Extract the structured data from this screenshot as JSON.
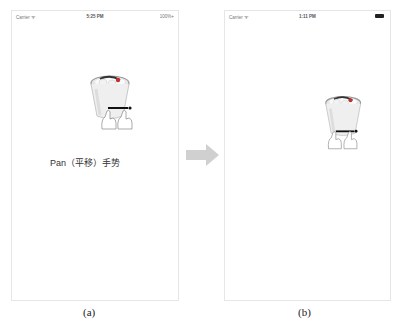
{
  "panels": [
    {
      "id": "a",
      "status_bar": {
        "carrier": "Carrier ᯤ",
        "time": "5:25 PM",
        "battery": "100%+"
      },
      "icon": "trash-can-pan-gesture-icon",
      "label": "Pan（平移）手势",
      "caption": "(a)"
    },
    {
      "id": "b",
      "status_bar": {
        "carrier": "Carrier ᯤ",
        "time": "1:11 PM",
        "battery": "battery-full-icon"
      },
      "icon": "trash-can-pan-gesture-icon",
      "caption": "(b)"
    }
  ],
  "transition": {
    "icon": "right-arrow-icon",
    "color": "#d0d0d0"
  }
}
